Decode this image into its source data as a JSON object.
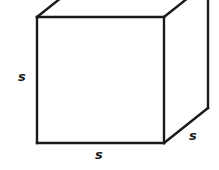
{
  "figure": {
    "type": "geometry-diagram",
    "shape_name": "cube",
    "background_color": "#ffffff",
    "stroke_color": "#1a1a1a",
    "label_color": "#1a1a1a",
    "labels": {
      "height": "s",
      "width": "s",
      "depth": "s"
    },
    "geometry": {
      "front_face": {
        "top_left": [
          37,
          17
        ],
        "top_right": [
          164,
          17
        ],
        "bottom_right": [
          164,
          143
        ],
        "bottom_left": [
          37,
          143
        ]
      },
      "back_top_right": [
        208,
        0
      ],
      "back_right_bottom": [
        208,
        108
      ],
      "back_top_left_offscreen": [
        81,
        -36
      ],
      "stroke_width": 2.4
    }
  }
}
